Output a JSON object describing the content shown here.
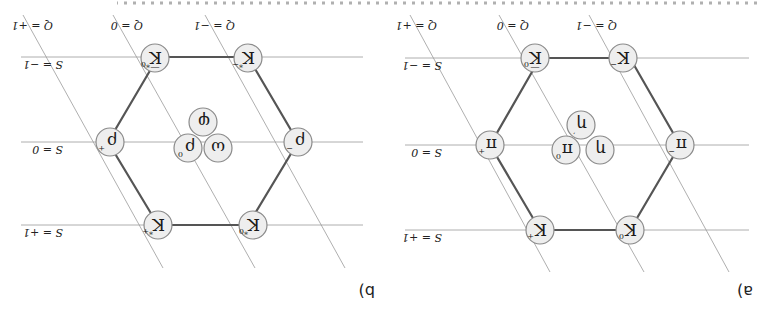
{
  "orientation": "rotated-180",
  "caption_fragment": "(partially cut-off caption text along top edge, illegible)",
  "colors": {
    "node_fill": "#eeeeee",
    "node_stroke": "#8a8a8a",
    "edge": "#555555",
    "grid": "#9a9a9a",
    "text": "#1a1a1a"
  },
  "panels": [
    {
      "label": "a)",
      "title": "Pseudoscalar meson nonet",
      "strangeness_labels": [
        "S = +1",
        "S = 0",
        "S = −1"
      ],
      "charge_labels": [
        "Q = −1",
        "Q = 0",
        "Q = +1"
      ],
      "particles": {
        "top_left": {
          "base": "K",
          "sup": "0"
        },
        "top_right": {
          "base": "K",
          "sup": "+"
        },
        "mid_left": {
          "base": "π",
          "sup": "−"
        },
        "mid_right": {
          "base": "π",
          "sup": "+"
        },
        "center_a": {
          "base": "π",
          "sup": "0"
        },
        "center_b": {
          "base": "η",
          "sup": ""
        },
        "center_c": {
          "base": "η",
          "sup": "′"
        },
        "bottom_left": {
          "base": "K",
          "sup": "−"
        },
        "bottom_right": {
          "base": "K̅",
          "sup": "0"
        }
      }
    },
    {
      "label": "b)",
      "title": "Vector meson nonet",
      "strangeness_labels": [
        "S = +1",
        "S = 0",
        "S = −1"
      ],
      "charge_labels": [
        "Q = −1",
        "Q = 0",
        "Q = +1"
      ],
      "particles": {
        "top_left": {
          "base": "K",
          "sup": "*0"
        },
        "top_right": {
          "base": "K",
          "sup": "*+"
        },
        "mid_left": {
          "base": "ρ",
          "sup": "−"
        },
        "mid_right": {
          "base": "ρ",
          "sup": "+"
        },
        "center_a": {
          "base": "ρ",
          "sup": "0"
        },
        "center_b": {
          "base": "ω",
          "sup": ""
        },
        "center_c": {
          "base": "φ",
          "sup": ""
        },
        "bottom_left": {
          "base": "K",
          "sup": "*−"
        },
        "bottom_right": {
          "base": "K̅",
          "sup": "*0"
        }
      }
    }
  ]
}
